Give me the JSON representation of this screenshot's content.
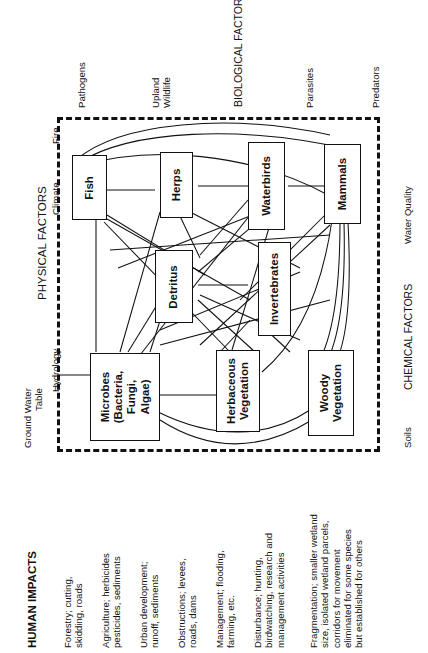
{
  "figure": {
    "title_physical": "PHYSICAL FACTORS",
    "title_biological": "BIOLOGICAL FACTORS",
    "title_chemical": "CHEMICAL FACTORS",
    "title_human": "HUMAN IMPACTS"
  },
  "physical_factors": [
    {
      "label": "Ground Water\nTable"
    },
    {
      "label": "Hydrology"
    },
    {
      "label": "Climate"
    },
    {
      "label": "Fire"
    }
  ],
  "biological_factors": [
    {
      "label": "Pathogens"
    },
    {
      "label": "Upland\nWildlife"
    },
    {
      "label": "Parasites"
    },
    {
      "label": "Predators"
    }
  ],
  "chemical_factors": [
    {
      "label": "Water Quality"
    },
    {
      "label": "Soils"
    }
  ],
  "nodes": [
    {
      "id": "fish",
      "label": "Fish"
    },
    {
      "id": "herps",
      "label": "Herps"
    },
    {
      "id": "waterbirds",
      "label": "Waterbirds"
    },
    {
      "id": "mammals",
      "label": "Mammals"
    },
    {
      "id": "detritus",
      "label": "Detritus"
    },
    {
      "id": "invertebrates",
      "label": "Invertebrates"
    },
    {
      "id": "microbes",
      "label": "Microbes\n(Bacteria,\nFungi,\nAlgae)"
    },
    {
      "id": "herbaceous",
      "label": "Herbaceous\nVegetation"
    },
    {
      "id": "woody",
      "label": "Woody\nVegetation"
    }
  ],
  "human_impacts": [
    {
      "text": "Forestry; cutting,\nskidding, roads"
    },
    {
      "text": "Agriculture; herbicides\npesticides, sediments"
    },
    {
      "text": "Urban development;\nrunoff, sediments"
    },
    {
      "text": "Obstructions; levees,\nroads, dams"
    },
    {
      "text": "Management; flooding,\nfarming, etc."
    },
    {
      "text": "Disturbance; hunting,\nbirdwatching, research and\nmanagement activities"
    },
    {
      "text": "Fragmentation; smaller wetland\nsize, isolated wetland parcels,\ncorridors for movement\neliminated for some species\nbut established for others"
    }
  ],
  "colors": {
    "ink": "#111111",
    "paper": "#ffffff"
  }
}
